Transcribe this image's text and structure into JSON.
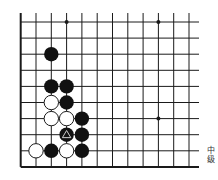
{
  "board": {
    "grid": {
      "origin_x": 20.7,
      "origin_y": 22,
      "spacing_x": 15.3,
      "spacing_y": 16.1,
      "cols": 12,
      "rows": 10,
      "line_top_extend": 13,
      "line_right_extend": 199,
      "left_edge": true,
      "bottom_edge": true
    },
    "colors": {
      "line": "#1a1a1a",
      "black_stone": "#111111",
      "white_stone": "#ffffff",
      "marker": "#cccccc"
    },
    "star_points": [
      {
        "col": 3,
        "row": 0
      },
      {
        "col": 9,
        "row": 0
      },
      {
        "col": 9,
        "row": 6
      }
    ],
    "stones": [
      {
        "col": 2,
        "row": 2,
        "color": "black"
      },
      {
        "col": 2,
        "row": 4,
        "color": "black"
      },
      {
        "col": 3,
        "row": 4,
        "color": "black"
      },
      {
        "col": 2,
        "row": 5,
        "color": "white"
      },
      {
        "col": 3,
        "row": 5,
        "color": "black"
      },
      {
        "col": 2,
        "row": 6,
        "color": "white"
      },
      {
        "col": 3,
        "row": 6,
        "color": "white"
      },
      {
        "col": 4,
        "row": 6,
        "color": "black"
      },
      {
        "col": 3,
        "row": 7,
        "color": "black",
        "marker": "triangle"
      },
      {
        "col": 4,
        "row": 7,
        "color": "black"
      },
      {
        "col": 1,
        "row": 8,
        "color": "white"
      },
      {
        "col": 2,
        "row": 8,
        "color": "black"
      },
      {
        "col": 3,
        "row": 8,
        "color": "white"
      },
      {
        "col": 4,
        "row": 8,
        "color": "black"
      }
    ]
  },
  "caption": {
    "line1": "中",
    "line2": "级"
  }
}
